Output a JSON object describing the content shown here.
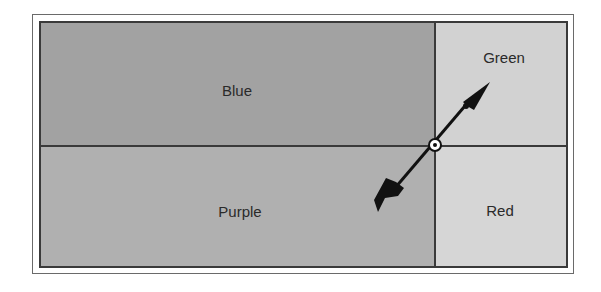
{
  "diagram": {
    "quadrants": [
      {
        "id": "blue",
        "label": "Blue",
        "color": "#a2a2a2"
      },
      {
        "id": "green",
        "label": "Green",
        "color": "#d2d2d2"
      },
      {
        "id": "purple",
        "label": "Purple",
        "color": "#b0b0b0"
      },
      {
        "id": "red",
        "label": "Red",
        "color": "#d6d6d6"
      }
    ],
    "divider_color": "#3a3a3a",
    "arrow": {
      "direction": "toward Green (up-right)",
      "tail": "Purple (down-left)",
      "pivot": "center intersection"
    }
  }
}
